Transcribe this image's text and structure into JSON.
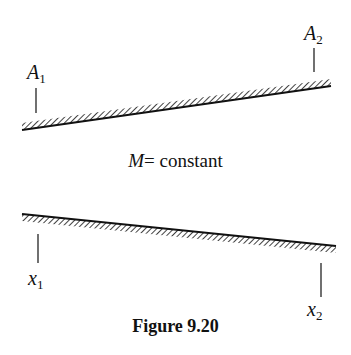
{
  "figure": {
    "caption": "Figure 9.20",
    "top_surface": {
      "start_label": {
        "var": "A",
        "sub": "1"
      },
      "end_label": {
        "var": "A",
        "sub": "2"
      }
    },
    "middle_text": {
      "var": "M",
      "rest": "= constant"
    },
    "bottom_surface": {
      "start_label": {
        "var": "x",
        "sub": "1"
      },
      "end_label": {
        "var": "x",
        "sub": "2"
      }
    }
  }
}
